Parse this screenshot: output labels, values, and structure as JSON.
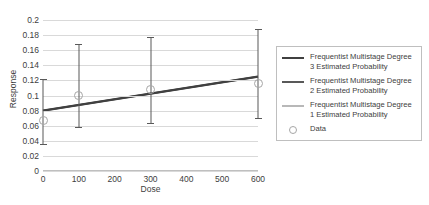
{
  "chart_data": {
    "type": "line",
    "title": "",
    "xlabel": "Dose",
    "ylabel": "Response",
    "xlim": [
      0,
      600
    ],
    "ylim": [
      0,
      0.2
    ],
    "grid": true,
    "legend_position": "right",
    "x_ticks": [
      "0",
      "100",
      "200",
      "300",
      "400",
      "500",
      "600"
    ],
    "x_tick_values": [
      0,
      100,
      200,
      300,
      400,
      500,
      600
    ],
    "y_ticks": [
      "0",
      "0.02",
      "0.04",
      "0.06",
      "0.08",
      "0.1",
      "0.12",
      "0.14",
      "0.16",
      "0.18",
      "0.2"
    ],
    "y_tick_values": [
      0,
      0.02,
      0.04,
      0.06,
      0.08,
      0.1,
      0.12,
      0.14,
      0.16,
      0.18,
      0.2
    ],
    "series": [
      {
        "name": "Frequentist Multistage Degree 3 Estimated Probability",
        "type": "line",
        "color": "#404040",
        "width": 2.2,
        "x": [
          0,
          600
        ],
        "values": [
          0.08,
          0.125
        ]
      },
      {
        "name": "Frequentist Multistage Degree 2 Estimated Probability",
        "type": "line",
        "color": "#595959",
        "width": 1.8,
        "x": [
          0,
          600
        ],
        "values": [
          0.08,
          0.125
        ]
      },
      {
        "name": "Frequentist Multistage Degree 1 Estimated Probability",
        "type": "line",
        "color": "#737373",
        "width": 1.4,
        "x": [
          0,
          600
        ],
        "values": [
          0.08,
          0.125
        ]
      },
      {
        "name": "Data",
        "type": "scatter",
        "marker": "open-circle",
        "color": "#a6a6a6",
        "x": [
          0,
          100,
          300,
          600
        ],
        "values": [
          0.067,
          0.1,
          0.108,
          0.116
        ],
        "error_low": [
          0.034,
          0.057,
          0.062,
          0.069
        ],
        "error_high": [
          0.122,
          0.168,
          0.178,
          0.188
        ]
      }
    ]
  },
  "legend": {
    "items": [
      {
        "label": "Frequentist Multistage Degree 3 Estimated Probability",
        "key": "line-thick"
      },
      {
        "label": "Frequentist Multistage Degree 2 Estimated Probability",
        "key": "line-medium"
      },
      {
        "label": "Frequentist Multistage Degree 1 Estimated Probability",
        "key": "line-thin"
      },
      {
        "label": "Data",
        "key": "open-circle-marker"
      }
    ]
  }
}
